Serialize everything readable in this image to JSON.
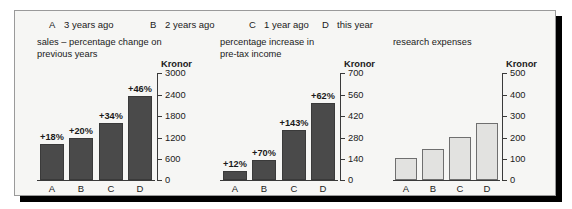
{
  "legend": {
    "items": [
      {
        "key": "A",
        "label": "3 years ago"
      },
      {
        "key": "B",
        "label": "2 years ago"
      },
      {
        "key": "C",
        "label": "1 year ago"
      },
      {
        "key": "D",
        "label": "this year"
      }
    ]
  },
  "axis_unit_label": "Kronor",
  "chart_data": [
    {
      "type": "bar",
      "title": "sales – percentage change on\nprevious years",
      "categories": [
        "A",
        "B",
        "C",
        "D"
      ],
      "values": [
        1020,
        1200,
        1600,
        2370
      ],
      "data_labels": [
        "+18%",
        "+20%",
        "+34%",
        "+46%"
      ],
      "ylabel": "Kronor",
      "xlabel": "",
      "ylim": [
        0,
        3000
      ],
      "yticks": [
        0,
        600,
        1200,
        1800,
        2400,
        3000
      ],
      "ytick_labels": [
        "0",
        "600",
        "1200",
        "1800",
        "2400",
        "3000"
      ],
      "grid": false,
      "legend_position": "top",
      "bar_style": "dark"
    },
    {
      "type": "bar",
      "title": "percentage increase in\npre-tax income",
      "categories": [
        "A",
        "B",
        "C",
        "D"
      ],
      "values": [
        60,
        135,
        330,
        510
      ],
      "data_labels": [
        "+12%",
        "+70%",
        "+143%",
        "+62%"
      ],
      "ylabel": "Kronor",
      "xlabel": "",
      "ylim": [
        0,
        700
      ],
      "yticks": [
        0,
        140,
        280,
        420,
        560,
        700
      ],
      "ytick_labels": [
        "0",
        "140",
        "280",
        "420",
        "560",
        "700"
      ],
      "grid": false,
      "legend_position": "top",
      "bar_style": "dark"
    },
    {
      "type": "bar",
      "title": "research expenses",
      "categories": [
        "A",
        "B",
        "C",
        "D"
      ],
      "values": [
        105,
        145,
        205,
        270
      ],
      "data_labels": [
        "",
        "",
        "",
        ""
      ],
      "ylabel": "Kronor",
      "xlabel": "",
      "ylim": [
        0,
        500
      ],
      "yticks": [
        0,
        100,
        200,
        300,
        400,
        500
      ],
      "ytick_labels": [
        "0",
        "100",
        "200",
        "300",
        "400",
        "500"
      ],
      "grid": false,
      "legend_position": "top",
      "bar_style": "light"
    }
  ],
  "colors": {
    "bar_dark": "#4a4a4a",
    "bar_light": "#e2e2e0",
    "axis": "#3a3a3a",
    "panel_bg": "#f6f6f4",
    "panel_border": "#9a9a9a",
    "shadow": "#000000"
  }
}
